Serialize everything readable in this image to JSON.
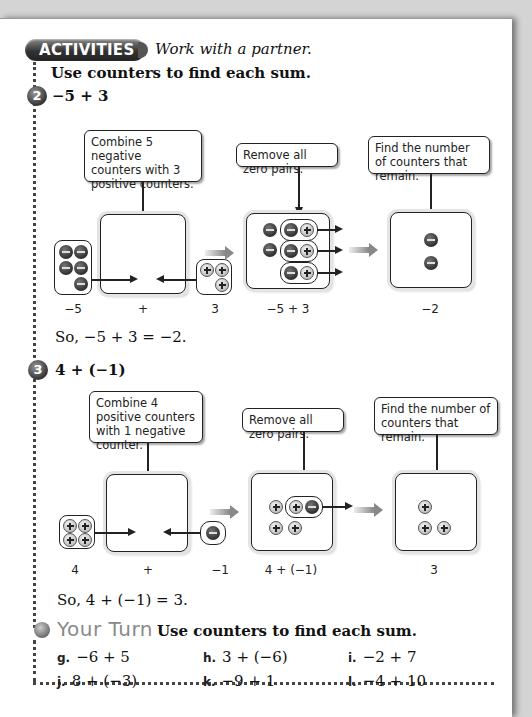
{
  "header": {
    "badge": "ACTIVITIES",
    "subtitle": "Work with a partner."
  },
  "instructions": "Use counters to find each sum.",
  "activities": [
    {
      "number": "2",
      "expression": "−5 + 3",
      "callouts": [
        "Combine 5 negative counters with 3 positive counters.",
        "Remove all zero pairs.",
        "Find the number of counters that remain."
      ],
      "captions": [
        "−5",
        "+",
        "3",
        "−5 + 3",
        "−2"
      ],
      "conclusion": "So, −5 + 3 = −2."
    },
    {
      "number": "3",
      "expression": "4 + (−1)",
      "callouts": [
        "Combine 4 positive counters with 1 negative counter.",
        "Remove all zero pairs.",
        "Find the number of counters that remain."
      ],
      "captions": [
        "4",
        "+",
        "−1",
        "4 + (−1)",
        "3"
      ],
      "conclusion": "So, 4 + (−1) = 3."
    }
  ],
  "your_turn": {
    "title": "Your Turn",
    "instructions": "Use counters to find each sum.",
    "exercises": [
      {
        "label": "g.",
        "expr": "−6 + 5"
      },
      {
        "label": "h.",
        "expr": "3 + (−6)"
      },
      {
        "label": "i.",
        "expr": "−2 + 7"
      },
      {
        "label": "j.",
        "expr": "8 + (−3)"
      },
      {
        "label": "k.",
        "expr": "−9 + 1"
      },
      {
        "label": "l.",
        "expr": "−4 + 10"
      }
    ]
  },
  "counter_types": {
    "negative": "minus-counter",
    "positive": "plus-counter"
  }
}
